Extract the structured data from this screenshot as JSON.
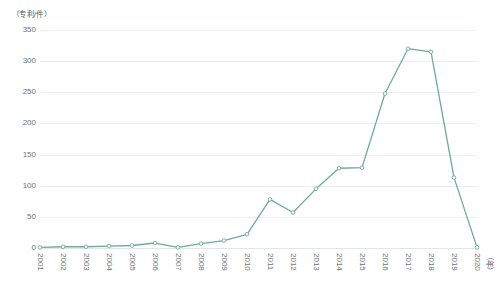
{
  "chart_data": {
    "type": "line",
    "title": "",
    "subtitle": "",
    "ylabel": "（专利/件）",
    "xlabel": "（年）",
    "categories": [
      "2001",
      "2002",
      "2003",
      "2004",
      "2005",
      "2006",
      "2007",
      "2008",
      "2009",
      "2010",
      "2011",
      "2012",
      "2013",
      "2014",
      "2015",
      "2016",
      "2017",
      "2018",
      "2019",
      "2020"
    ],
    "values": [
      1,
      2,
      2,
      3,
      4,
      8,
      1,
      7,
      12,
      22,
      78,
      57,
      95,
      128,
      129,
      248,
      320,
      315,
      113,
      1
    ],
    "series": [
      {
        "name": "专利申请量",
        "values": [
          1,
          2,
          2,
          3,
          4,
          8,
          1,
          7,
          12,
          22,
          78,
          57,
          95,
          128,
          129,
          248,
          320,
          315,
          113,
          1
        ]
      }
    ],
    "ylim": [
      0,
      350
    ],
    "yticks": [
      0,
      50,
      100,
      150,
      200,
      250,
      300,
      350
    ],
    "ytick_labels": [
      "0",
      "50",
      "100",
      "150",
      "200",
      "250",
      "300",
      "350"
    ],
    "grid": "horizontal",
    "legend": "none",
    "line_color": "#6fa89e",
    "marker_color": "#6fa89e",
    "marker_fill": "#ffffff",
    "gridline_color": "#eceff0",
    "background_color": "#ffffff",
    "text_color": "#6d7276"
  }
}
